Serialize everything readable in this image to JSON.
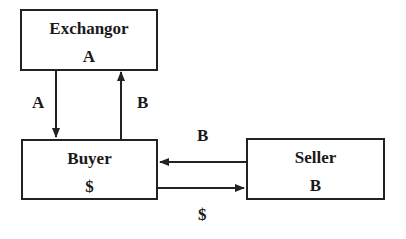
{
  "nodes": {
    "exchangor": {
      "title": "Exchangor",
      "value": "A"
    },
    "buyer": {
      "title": "Buyer",
      "value": "$"
    },
    "seller": {
      "title": "Seller",
      "value": "B"
    }
  },
  "edges": [
    {
      "from": "exchangor",
      "to": "buyer",
      "label": "A"
    },
    {
      "from": "buyer",
      "to": "exchangor",
      "label": "B"
    },
    {
      "from": "seller",
      "to": "buyer",
      "label": "B"
    },
    {
      "from": "buyer",
      "to": "seller",
      "label": "$"
    }
  ],
  "colors": {
    "stroke": "#222222",
    "background": "#ffffff"
  }
}
